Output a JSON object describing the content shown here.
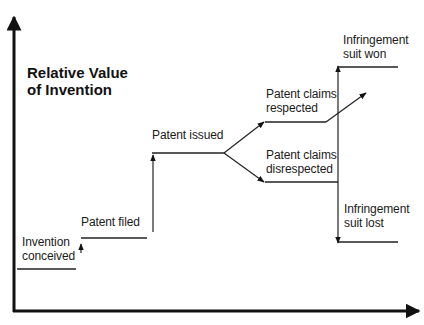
{
  "title": {
    "line1": "Relative Value",
    "line2": "of Invention"
  },
  "stages": {
    "invention_conceived": {
      "line1": "Invention",
      "line2": "conceived"
    },
    "patent_filed": {
      "line1": "Patent filed"
    },
    "patent_issued": {
      "line1": "Patent issued"
    },
    "claims_respected": {
      "line1": "Patent claims",
      "line2": "respected"
    },
    "claims_disrespected": {
      "line1": "Patent claims",
      "line2": "disrespected"
    },
    "suit_won": {
      "line1": "Infringement",
      "line2": "suit won"
    },
    "suit_lost": {
      "line1": "Infringement",
      "line2": "suit lost"
    }
  },
  "colors": {
    "ink": "#1a1a1a",
    "background": "#ffffff"
  }
}
